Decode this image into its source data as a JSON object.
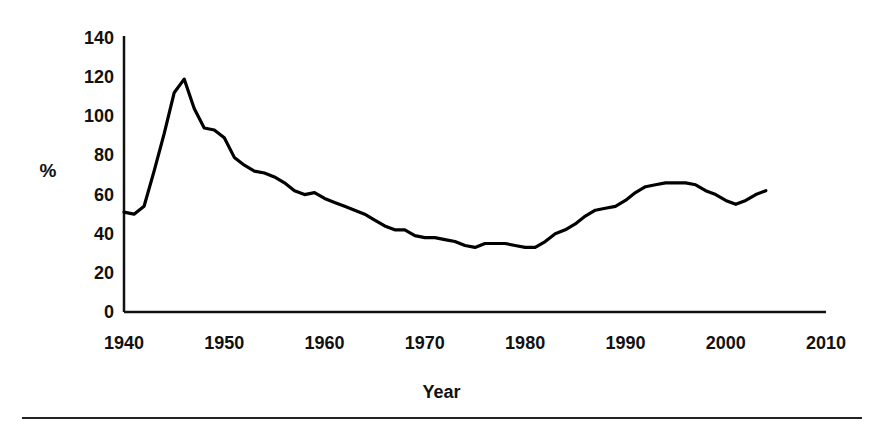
{
  "figure": {
    "y_unit_label": "%",
    "x_axis_title": "Year",
    "line_color": "#000000",
    "background_color": "#ffffff",
    "axis_color": "#111111"
  },
  "chart_data": {
    "type": "line",
    "title": "",
    "subtitle": "",
    "xlabel": "Year",
    "ylabel": "%",
    "xlim": [
      1940,
      2010
    ],
    "ylim": [
      0,
      140
    ],
    "grid": false,
    "legend": null,
    "legend_position": "none",
    "xticks": [
      1940,
      1950,
      1960,
      1970,
      1980,
      1990,
      2000,
      2010
    ],
    "xtick_labels": [
      "1940",
      "1950",
      "1960",
      "1970",
      "1980",
      "1990",
      "2000",
      "2010"
    ],
    "yticks": [
      0,
      20,
      40,
      60,
      80,
      100,
      120,
      140
    ],
    "ytick_labels": [
      "0",
      "20",
      "40",
      "60",
      "80",
      "100",
      "120",
      "140"
    ],
    "series": [
      {
        "name": "percent",
        "color": "#000000",
        "x": [
          1940,
          1941,
          1942,
          1943,
          1944,
          1945,
          1946,
          1947,
          1948,
          1949,
          1950,
          1951,
          1952,
          1953,
          1954,
          1955,
          1956,
          1957,
          1958,
          1959,
          1960,
          1961,
          1962,
          1963,
          1964,
          1965,
          1966,
          1967,
          1968,
          1969,
          1970,
          1971,
          1972,
          1973,
          1974,
          1975,
          1976,
          1977,
          1978,
          1979,
          1980,
          1981,
          1982,
          1983,
          1984,
          1985,
          1986,
          1987,
          1988,
          1989,
          1990,
          1991,
          1992,
          1993,
          1994,
          1995,
          1996,
          1997,
          1998,
          1999,
          2000,
          2001,
          2002,
          2003,
          2004
        ],
        "y": [
          51,
          50,
          54,
          72,
          91,
          112,
          119,
          104,
          94,
          93,
          89,
          79,
          75,
          72,
          71,
          69,
          66,
          62,
          60,
          61,
          58,
          56,
          54,
          52,
          50,
          47,
          44,
          42,
          42,
          39,
          38,
          38,
          37,
          36,
          34,
          33,
          35,
          35,
          35,
          34,
          33,
          33,
          36,
          40,
          42,
          45,
          49,
          52,
          53,
          54,
          57,
          61,
          64,
          65,
          66,
          66,
          66,
          65,
          62,
          60,
          57,
          55,
          57,
          60,
          62
        ],
        "annotations": [
          {
            "label": "peak",
            "x": 1946,
            "y": 119
          },
          {
            "label": "trough",
            "x": 1974,
            "y": 34
          },
          {
            "label": "trough",
            "x": 1981,
            "y": 33
          },
          {
            "label": "local peak",
            "x": 1995,
            "y": 66
          },
          {
            "label": "local dip",
            "x": 2001,
            "y": 55
          },
          {
            "label": "end",
            "x": 2004,
            "y": 62
          }
        ]
      }
    ]
  }
}
